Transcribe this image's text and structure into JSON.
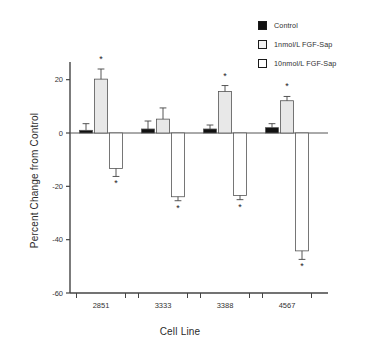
{
  "chart_data": {
    "type": "bar",
    "title": "",
    "xlabel": "Cell Line",
    "ylabel": "Percent Change from Control",
    "categories": [
      "2851",
      "3333",
      "3388",
      "4567"
    ],
    "ylim": [
      -60,
      28
    ],
    "yticks": [
      20,
      0,
      -20,
      -40,
      -60
    ],
    "ytick_labels": [
      "20",
      "0",
      "-20",
      "-40",
      "-60"
    ],
    "grid": false,
    "legend_position": "top-right",
    "zero_line": true,
    "series": [
      {
        "name": "Control",
        "fill": "#111111",
        "values": [
          1,
          1.5,
          1.5,
          2
        ],
        "errors": [
          2.5,
          3,
          1.5,
          1.5
        ],
        "significant": [
          false,
          false,
          false,
          false
        ]
      },
      {
        "name": "1nmol/L FGF-Sap",
        "fill": "#e8e8e8",
        "values": [
          20.2,
          5.2,
          15.6,
          12.1
        ],
        "errors": [
          3.8,
          4.2,
          2.2,
          1.6
        ],
        "significant": [
          true,
          false,
          true,
          true
        ]
      },
      {
        "name": "10nmol/L FGF-Sap",
        "fill": "#ffffff",
        "values": [
          -13.3,
          -23.9,
          -23.4,
          -44.2
        ],
        "errors": [
          3.0,
          1.5,
          1.6,
          3.2
        ],
        "significant": [
          true,
          true,
          true,
          true
        ]
      }
    ],
    "significance_marker": "*"
  },
  "legend": {
    "items": [
      {
        "label": "Control",
        "swatch": "black-filled-square"
      },
      {
        "label": "1nmol/L FGF-Sap",
        "swatch": "light-gray-square"
      },
      {
        "label": "10nmol/L FGF-Sap",
        "swatch": "white-square"
      }
    ]
  },
  "colors": {
    "axis": "#444444",
    "text": "#2b2b2b",
    "control_fill": "#111111",
    "low_dose_fill": "#e8e8e8",
    "high_dose_fill": "#ffffff",
    "bar_stroke": "#555555"
  }
}
